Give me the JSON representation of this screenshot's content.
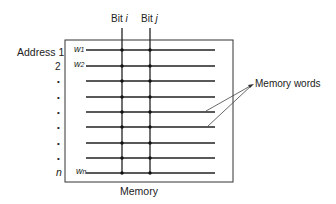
{
  "diagram": {
    "title_label": "Memory",
    "bit_labels": [
      {
        "prefix": "Bit ",
        "var": "i"
      },
      {
        "prefix": "Bit ",
        "var": "j"
      }
    ],
    "address_label": "Address 1",
    "address_rows": [
      "2",
      "•",
      "•",
      "•",
      "•",
      "•",
      "•",
      "n"
    ],
    "word_labels": [
      {
        "base": "w",
        "sub": "1"
      },
      {
        "base": "w",
        "sub": "2"
      },
      {
        "base": "w",
        "sub": "n"
      }
    ],
    "callout_label": "Memory words",
    "word_line_count": 9,
    "bit_line_count": 2
  }
}
